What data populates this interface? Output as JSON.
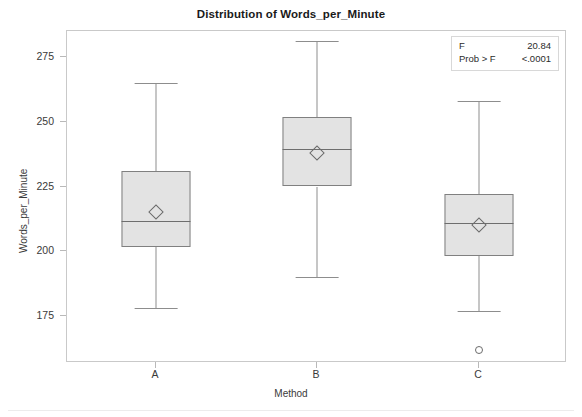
{
  "chart_data": {
    "type": "box",
    "title": "Distribution of Words_per_Minute",
    "xlabel": "Method",
    "ylabel": "Words_per_Minute",
    "categories": [
      "A",
      "B",
      "C"
    ],
    "ylim": [
      158,
      287
    ],
    "yticks": [
      175,
      200,
      225,
      250,
      275
    ],
    "ytick_labels": [
      "175",
      "200",
      "225",
      "250",
      "275"
    ],
    "grid": false,
    "legend": false,
    "boxes": [
      {
        "category": "A",
        "whisker_low": 178,
        "q1": 201.5,
        "median": 211.5,
        "q3": 231,
        "whisker_high": 265,
        "mean": 215,
        "outliers": []
      },
      {
        "category": "B",
        "whisker_low": 190,
        "q1": 225,
        "median": 239.5,
        "q3": 252,
        "whisker_high": 281,
        "mean": 238,
        "outliers": []
      },
      {
        "category": "C",
        "whisker_low": 177,
        "q1": 198,
        "median": 211,
        "q3": 222,
        "whisker_high": 258,
        "mean": 210,
        "outliers": [
          162
        ]
      }
    ],
    "annotations": {
      "f_label": "F",
      "f_value": "20.84",
      "prob_label": "Prob > F",
      "prob_value": "<.0001"
    },
    "colors": {
      "box_fill": "#e3e3e3",
      "box_border": "#808080",
      "whisker": "#8d8d8d",
      "frame": "#c9c9c9",
      "text": "#3a3a3a"
    }
  }
}
